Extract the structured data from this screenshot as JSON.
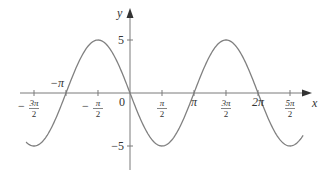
{
  "chart_data": {
    "type": "line",
    "title": "",
    "function": "y = -5 sin(x)",
    "xlabel": "x",
    "ylabel": "y",
    "xlim": [
      -4.2,
      8.7
    ],
    "ylim": [
      -5.5,
      5.5
    ],
    "grid": false,
    "legend": null,
    "x_ticks": [
      {
        "value": -4.712,
        "label_num": "3π",
        "label_den": "2",
        "sign": "−"
      },
      {
        "value": -1.571,
        "label_num": "π",
        "label_den": "2",
        "sign": "−"
      },
      {
        "value": 1.571,
        "label_num": "π",
        "label_den": "2",
        "sign": ""
      },
      {
        "value": 4.712,
        "label_num": "3π",
        "label_den": "2",
        "sign": ""
      },
      {
        "value": 7.854,
        "label_num": "5π",
        "label_den": "2",
        "sign": ""
      }
    ],
    "x_inline_labels": [
      {
        "value": -3.1416,
        "label": "−π",
        "position": "above"
      },
      {
        "value": 3.1416,
        "label": "π",
        "position": "below"
      },
      {
        "value": 6.2832,
        "label": "2π",
        "position": "below"
      }
    ],
    "y_ticks": [
      {
        "value": 5,
        "label": "5"
      },
      {
        "value": -5,
        "label": "−5"
      }
    ],
    "origin_label": "0",
    "series": [
      {
        "name": "y = -5 sin x",
        "x": [
          -5.1,
          -4.712,
          -3.927,
          -3.1416,
          -2.356,
          -1.571,
          -0.785,
          0,
          0.785,
          1.571,
          2.356,
          3.1416,
          3.927,
          4.712,
          5.498,
          6.2832,
          7.069,
          7.854,
          8.5
        ],
        "y": [
          -4.63,
          -5,
          -3.54,
          0,
          3.54,
          5,
          3.54,
          0,
          -3.54,
          -5,
          -3.54,
          0,
          3.54,
          5,
          3.54,
          0,
          -3.54,
          -5,
          -3.99
        ],
        "color": "#808080"
      }
    ]
  },
  "colors": {
    "axis": "#7a7a7a",
    "curve": "#808080",
    "text": "#333333"
  }
}
